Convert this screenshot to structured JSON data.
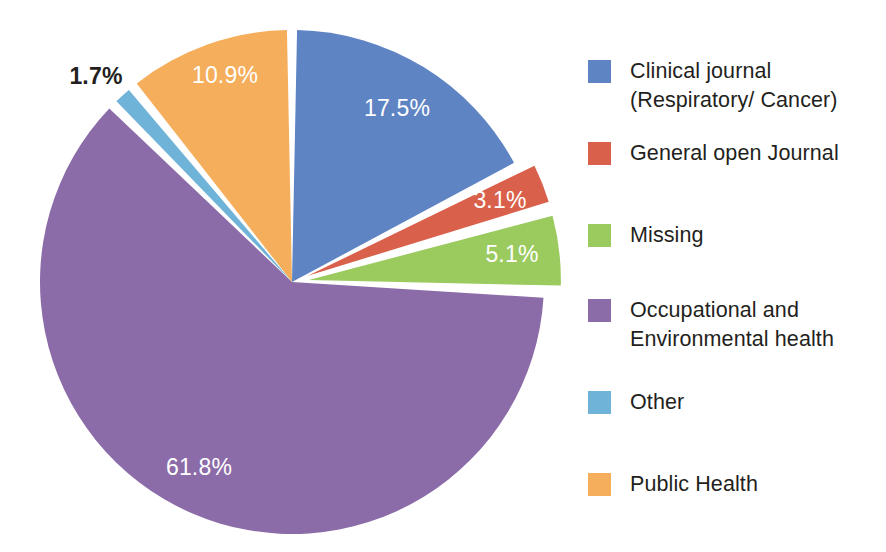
{
  "chart_data": {
    "type": "pie",
    "title": "",
    "subtitle": "",
    "xlabel": "",
    "ylabel": "",
    "legend_position": "right",
    "grid": false,
    "units": "percent",
    "start_angle_deg": 0,
    "direction": "clockwise",
    "categories": [
      "Clinical journal (Respiratory/ Cancer)",
      "General open Journal",
      "Missing",
      "Occupational and Environmental health",
      "Other",
      "Public Health"
    ],
    "values": [
      17.5,
      3.1,
      5.1,
      61.8,
      1.7,
      10.9
    ],
    "slices": [
      {
        "name": "Clinical journal (Respiratory/ Cancer)",
        "value": 17.5,
        "label": "17.5%",
        "color": "#5E84C4",
        "label_color": "#ffffff",
        "label_inside": true,
        "exploded": false
      },
      {
        "name": "General open Journal",
        "value": 3.1,
        "label": "3.1%",
        "color": "#D9604A",
        "label_color": "#ffffff",
        "label_inside": true,
        "exploded": true
      },
      {
        "name": "Missing",
        "value": 5.1,
        "label": "5.1%",
        "color": "#9BCA5F",
        "label_color": "#ffffff",
        "label_inside": true,
        "exploded": true
      },
      {
        "name": "Occupational and Environmental health",
        "value": 61.8,
        "label": "61.8%",
        "color": "#8C6CA8",
        "label_color": "#ffffff",
        "label_inside": true,
        "exploded": false
      },
      {
        "name": "Other",
        "value": 1.7,
        "label": "1.7%",
        "color": "#6FB3D9",
        "label_color": "#231f20",
        "label_inside": false,
        "exploded": false
      },
      {
        "name": "Public Health",
        "value": 10.9,
        "label": "10.9%",
        "color": "#F5AE5C",
        "label_color": "#ffffff",
        "label_inside": true,
        "exploded": false
      }
    ]
  },
  "labels": {
    "blue": "17.5%",
    "red": "3.1%",
    "green": "5.1%",
    "purple": "61.8%",
    "teal": "1.7%",
    "orange": "10.9%"
  },
  "legend": {
    "items": [
      {
        "label": "Clinical journal\n(Respiratory/ Cancer)",
        "color": "#5E84C4"
      },
      {
        "label": "General open Journal",
        "color": "#D9604A"
      },
      {
        "label": "Missing",
        "color": "#9BCA5F"
      },
      {
        "label": "Occupational and\nEnvironmental health",
        "color": "#8C6CA8"
      },
      {
        "label": "Other",
        "color": "#6FB3D9"
      },
      {
        "label": "Public Health",
        "color": "#F5AE5C"
      }
    ]
  }
}
